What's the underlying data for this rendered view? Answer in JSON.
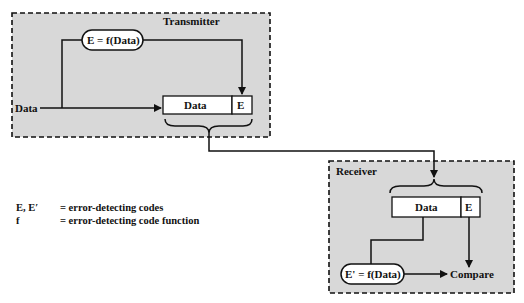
{
  "transmitter": {
    "title": "Transmitter",
    "input_label": "Data",
    "function_label": "E = f(Data)",
    "packet": {
      "data_label": "Data",
      "code_label": "E"
    }
  },
  "receiver": {
    "title": "Receiver",
    "packet": {
      "data_label": "Data",
      "code_label": "E"
    },
    "function_label": "E' = f(Data)",
    "compare_label": "Compare"
  },
  "legend": {
    "items": [
      {
        "symbol": "E, E′",
        "definition": "= error-detecting codes"
      },
      {
        "symbol": "f",
        "definition": "= error-detecting code function"
      }
    ]
  },
  "colors": {
    "panel_fill": "#d8d8d8",
    "stroke": "#111111",
    "box_fill": "#ffffff"
  }
}
